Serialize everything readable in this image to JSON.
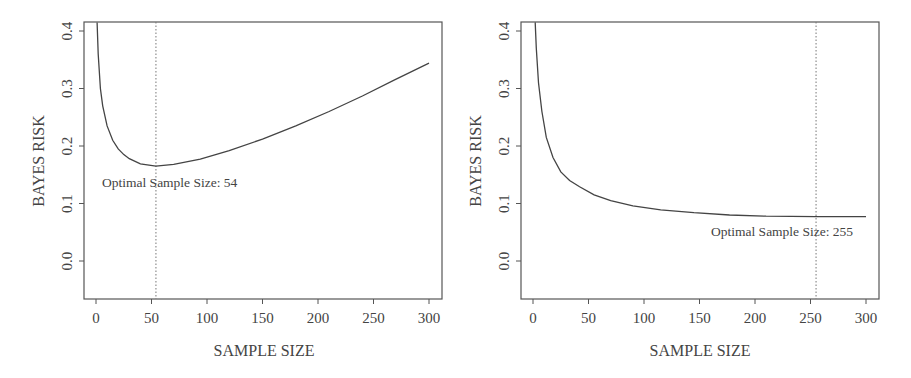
{
  "chart_data": [
    {
      "type": "line",
      "title": "",
      "xlabel": "SAMPLE SIZE",
      "ylabel": "BAYES RISK",
      "xlim": [
        -10,
        310
      ],
      "ylim": [
        -0.065,
        0.415
      ],
      "xticks": [
        0,
        50,
        100,
        150,
        200,
        250,
        300
      ],
      "yticks": [
        "0.0",
        "0.1",
        "0.2",
        "0.3",
        "0.4"
      ],
      "grid": false,
      "series": [
        {
          "name": "Bayes risk",
          "x": [
            1,
            2,
            4,
            6,
            10,
            15,
            20,
            25,
            30,
            40,
            54,
            70,
            94,
            120,
            150,
            180,
            210,
            240,
            269,
            300
          ],
          "values": [
            0.415,
            0.36,
            0.3,
            0.27,
            0.235,
            0.21,
            0.195,
            0.185,
            0.178,
            0.169,
            0.165,
            0.168,
            0.177,
            0.192,
            0.212,
            0.235,
            0.26,
            0.287,
            0.315,
            0.344
          ]
        }
      ],
      "annotations": [
        {
          "type": "vline",
          "x": 54,
          "style": "dotted"
        },
        {
          "type": "text",
          "text": "Optimal Sample Size: 54",
          "x": 2,
          "y": 0.135
        }
      ]
    },
    {
      "type": "line",
      "title": "",
      "xlabel": "SAMPLE SIZE",
      "ylabel": "BAYES RISK",
      "xlim": [
        -10,
        310
      ],
      "ylim": [
        -0.065,
        0.415
      ],
      "xticks": [
        0,
        50,
        100,
        150,
        200,
        250,
        300
      ],
      "yticks": [
        "0.0",
        "0.1",
        "0.2",
        "0.3",
        "0.4"
      ],
      "grid": false,
      "series": [
        {
          "name": "Bayes risk",
          "x": [
            2,
            3,
            5,
            8,
            12,
            18,
            25,
            33,
            42,
            55,
            70,
            90,
            115,
            145,
            177,
            210,
            255,
            300
          ],
          "values": [
            0.415,
            0.37,
            0.31,
            0.26,
            0.215,
            0.18,
            0.155,
            0.14,
            0.129,
            0.115,
            0.105,
            0.096,
            0.089,
            0.084,
            0.08,
            0.078,
            0.077,
            0.077
          ]
        }
      ],
      "annotations": [
        {
          "type": "vline",
          "x": 255,
          "style": "dotted"
        },
        {
          "type": "text",
          "text": "Optimal Sample Size: 255",
          "x": 160,
          "y": 0.06
        }
      ]
    }
  ],
  "panels": [
    {
      "xlabel": "SAMPLE SIZE",
      "ylabel": "BAYES RISK",
      "annotation": "Optimal Sample Size: 54",
      "xtick_labels": [
        "0",
        "50",
        "100",
        "150",
        "200",
        "250",
        "300"
      ],
      "ytick_labels": [
        "0.0",
        "0.1",
        "0.2",
        "0.3",
        "0.4"
      ]
    },
    {
      "xlabel": "SAMPLE SIZE",
      "ylabel": "BAYES RISK",
      "annotation": "Optimal Sample Size: 255",
      "xtick_labels": [
        "0",
        "50",
        "100",
        "150",
        "200",
        "250",
        "300"
      ],
      "ytick_labels": [
        "0.0",
        "0.1",
        "0.2",
        "0.3",
        "0.4"
      ]
    }
  ],
  "colors": {
    "line": "#444444",
    "axis": "#555555",
    "text": "#444444"
  }
}
